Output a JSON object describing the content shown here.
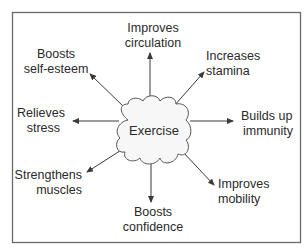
{
  "diagram": {
    "type": "radial-mind-map",
    "center": {
      "label": "Exercise",
      "shape": "cloud"
    },
    "benefits": [
      {
        "id": "circulation",
        "lines": [
          "Improves",
          "circulation"
        ],
        "direction": "up"
      },
      {
        "id": "stamina",
        "lines": [
          "Increases",
          "stamina"
        ],
        "direction": "up-right"
      },
      {
        "id": "immunity",
        "lines": [
          "Builds up",
          "immunity"
        ],
        "direction": "right"
      },
      {
        "id": "mobility",
        "lines": [
          "Improves",
          "mobility"
        ],
        "direction": "down-right"
      },
      {
        "id": "confidence",
        "lines": [
          "Boosts",
          "confidence"
        ],
        "direction": "down"
      },
      {
        "id": "muscles",
        "lines": [
          "Strengthens",
          "muscles"
        ],
        "direction": "down-left"
      },
      {
        "id": "stress",
        "lines": [
          "Relieves",
          "stress"
        ],
        "direction": "left"
      },
      {
        "id": "self-esteem",
        "lines": [
          "Boosts",
          "self-esteem"
        ],
        "direction": "up-left"
      }
    ]
  },
  "colors": {
    "text": "#2a2a2a",
    "arrow": "#3a3a3a",
    "frame": "#6a6a6a",
    "cloud_fill": "#f7f7f7"
  }
}
